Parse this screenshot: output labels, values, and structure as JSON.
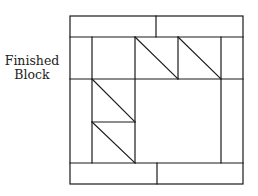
{
  "label": {
    "line1": "Finished",
    "line2": "Block"
  },
  "diagram": {
    "title": "Finished Block",
    "stroke_color": "#1a1a1a",
    "background": "#ffffff",
    "outer": {
      "x1": 70,
      "y1": 16,
      "x2": 243,
      "y2": 184
    },
    "pieces": [
      "top-band-left",
      "top-band-right",
      "left-border-strip",
      "right-border-strip",
      "top-left-square",
      "half-square-triangle-top-1",
      "half-square-triangle-top-2",
      "half-square-triangle-left-1",
      "half-square-triangle-left-2",
      "center-square",
      "bottom-band-left",
      "bottom-band-right"
    ]
  }
}
